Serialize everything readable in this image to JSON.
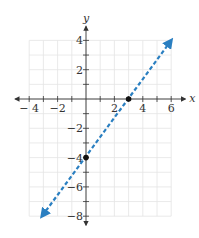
{
  "chart_data": {
    "type": "line",
    "title": "",
    "xlabel": "x",
    "ylabel": "y",
    "xlim": [
      -4,
      6
    ],
    "ylim": [
      -8,
      4
    ],
    "grid": true,
    "x_tick_labels": [
      {
        "value": -4,
        "label": "− 4"
      },
      {
        "value": -2,
        "label": "−2"
      },
      {
        "value": 2,
        "label": "2"
      },
      {
        "value": 4,
        "label": "4"
      },
      {
        "value": 6,
        "label": "6"
      }
    ],
    "y_tick_labels": [
      {
        "value": 4,
        "label": "4"
      },
      {
        "value": 2,
        "label": "2"
      },
      {
        "value": -2,
        "label": "−2"
      },
      {
        "value": -4,
        "label": "−4"
      },
      {
        "value": -6,
        "label": "−6"
      },
      {
        "value": -8,
        "label": "−8"
      }
    ],
    "series": [
      {
        "name": "y = (4/3)x − 4",
        "style": "dashed",
        "arrows": "both",
        "color": "#2a7fc1",
        "x": [
          -4,
          6
        ],
        "y": [
          -9.333,
          4
        ],
        "drawn_endpoints": [
          [
            -3.1,
            -8
          ],
          [
            6,
            4
          ]
        ]
      }
    ],
    "points": [
      {
        "name": "x-intercept",
        "x": 3,
        "y": 0
      },
      {
        "name": "y-intercept",
        "x": 0,
        "y": -4
      }
    ]
  },
  "colors": {
    "line": "#2a7fc1",
    "axis": "#333333",
    "grid": "#e4e4e4",
    "point": "#111111"
  }
}
